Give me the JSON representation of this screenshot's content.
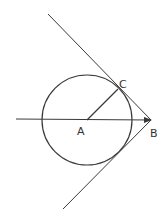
{
  "diagram": {
    "stroke_color": "#3a3a3a",
    "label_color": "#333333",
    "points": {
      "A": {
        "label": "A",
        "x": 87,
        "y": 120,
        "label_x": 77,
        "label_y": 135
      },
      "B": {
        "label": "B",
        "x": 151,
        "y": 120,
        "label_x": 150,
        "label_y": 137
      },
      "C": {
        "label": "C",
        "x": 118,
        "y": 89,
        "label_x": 119,
        "label_y": 88
      }
    },
    "circle": {
      "cx": 87,
      "cy": 120,
      "r": 45
    },
    "lines": [
      {
        "name": "upper-tangent-line",
        "x1": 48,
        "y1": 14,
        "x2": 151,
        "y2": 120
      },
      {
        "name": "lower-tangent-line",
        "x1": 151,
        "y1": 120,
        "x2": 63,
        "y2": 209
      },
      {
        "name": "radius-AC",
        "x1": 87,
        "y1": 120,
        "x2": 118,
        "y2": 89
      },
      {
        "name": "ray-to-B",
        "x1": 16,
        "y1": 119,
        "x2": 151,
        "y2": 120,
        "arrow": true
      }
    ]
  }
}
